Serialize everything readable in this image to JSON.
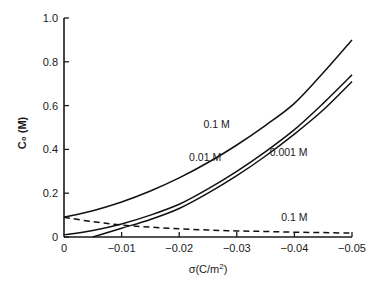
{
  "chart_data": {
    "type": "line",
    "title": "",
    "xlabel": "σ (C/m²)",
    "ylabel": "C₀ (M)",
    "xlim": [
      0,
      -0.05
    ],
    "ylim": [
      0,
      1.0
    ],
    "x_ticks": [
      0,
      -0.01,
      -0.02,
      -0.03,
      -0.04,
      -0.05
    ],
    "x_tick_labels": [
      "0",
      "-0.01",
      "-0.02",
      "-0.03",
      "-0.04",
      "-0.05"
    ],
    "y_ticks": [
      0,
      0.2,
      0.4,
      0.6,
      0.8,
      1.0
    ],
    "y_tick_labels": [
      "0",
      "0.2",
      "0.4",
      "0.6",
      "0.8",
      "1.0"
    ],
    "grid": false,
    "legend": "inline labels",
    "series": [
      {
        "name": "0.1 M",
        "style": "solid",
        "x": [
          0,
          -0.005,
          -0.01,
          -0.015,
          -0.02,
          -0.025,
          -0.03,
          -0.035,
          -0.04,
          -0.045,
          -0.05
        ],
        "values": [
          0.09,
          0.12,
          0.16,
          0.21,
          0.27,
          0.34,
          0.42,
          0.51,
          0.61,
          0.75,
          0.9
        ]
      },
      {
        "name": "0.01 M",
        "style": "solid",
        "x": [
          0,
          -0.005,
          -0.01,
          -0.015,
          -0.02,
          -0.025,
          -0.03,
          -0.035,
          -0.04,
          -0.045,
          -0.05
        ],
        "values": [
          0.01,
          0.03,
          0.06,
          0.1,
          0.15,
          0.22,
          0.3,
          0.39,
          0.49,
          0.61,
          0.74
        ]
      },
      {
        "name": "0.001 M",
        "style": "solid",
        "x": [
          -0.005,
          -0.01,
          -0.015,
          -0.02,
          -0.025,
          -0.03,
          -0.035,
          -0.04,
          -0.045,
          -0.05
        ],
        "values": [
          0.0,
          0.04,
          0.08,
          0.13,
          0.2,
          0.28,
          0.37,
          0.47,
          0.58,
          0.71
        ]
      },
      {
        "name": "0.1 M (dashed)",
        "style": "dashed",
        "x": [
          0,
          -0.005,
          -0.01,
          -0.015,
          -0.02,
          -0.025,
          -0.03,
          -0.035,
          -0.04,
          -0.045,
          -0.05
        ],
        "values": [
          0.09,
          0.07,
          0.055,
          0.045,
          0.038,
          0.032,
          0.028,
          0.025,
          0.022,
          0.02,
          0.018
        ]
      }
    ],
    "annotations": [
      {
        "text": "0.1 M",
        "series": "0.1 M",
        "x": -0.0265,
        "y": 0.5
      },
      {
        "text": "0.01 M",
        "series": "0.01 M",
        "x": -0.0245,
        "y": 0.345
      },
      {
        "text": "0.001 M",
        "series": "0.001 M",
        "x": -0.039,
        "y": 0.37
      },
      {
        "text": "0.1 M",
        "series": "0.1 M (dashed)",
        "x": -0.04,
        "y": 0.075
      }
    ]
  },
  "labels": {
    "ylabel": "C₀ (M)",
    "xlabel_main": "σ",
    "xlabel_unit": "(C/m",
    "xlabel_sup": "2",
    "xlabel_close": ")"
  }
}
